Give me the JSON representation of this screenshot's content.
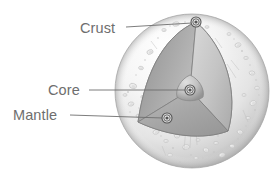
{
  "figure": {
    "background_color": "#ffffff"
  },
  "labels": [
    {
      "id": "crust",
      "text": "Crust",
      "text_x": 80,
      "text_y": 33,
      "line_x1": 126,
      "line_y1": 27,
      "line_x2": 192,
      "line_y2": 23,
      "marker_x": 196,
      "marker_y": 22
    },
    {
      "id": "core",
      "text": "Core",
      "text_x": 48,
      "text_y": 95,
      "line_x1": 89,
      "line_y1": 90,
      "line_x2": 185,
      "line_y2": 90,
      "marker_x": 190,
      "marker_y": 90
    },
    {
      "id": "mantle",
      "text": "Mantle",
      "text_x": 13,
      "text_y": 120,
      "line_x1": 70,
      "line_y1": 115,
      "line_x2": 163,
      "line_y2": 118,
      "marker_x": 167,
      "marker_y": 118
    }
  ],
  "sphere": {
    "center_x": 192,
    "center_y": 91,
    "radius": 77,
    "surface_color_light": "#fdfdfd",
    "surface_color_mid": "#e9e9e9",
    "surface_color_dark": "#c2c2c2",
    "outline_color": "#b4b4b4"
  },
  "cutaway": {
    "vertex_top_x": 196,
    "vertex_top_y": 22,
    "vertex_left_x": 138,
    "vertex_left_y": 122,
    "vertex_right_x": 228,
    "vertex_right_y": 131,
    "face_left_color": "#9d9d9d",
    "face_right_color": "#c9c9c9",
    "face_bottom_color": "#b0b0b0",
    "edge_color": "#808080"
  },
  "core_shape": {
    "center_x": 190,
    "center_y": 90,
    "size": 15,
    "fill_light": "#d6d6d6",
    "fill_dark": "#9b9b9b"
  },
  "markers": {
    "outer_radius": 5.0,
    "mid_radius": 3.2,
    "inner_radius": 1.6,
    "ring_color": "#555555",
    "fill_color": "#e8e8e8"
  },
  "craters": [
    {
      "cx": 150,
      "cy": 52,
      "rx": 3.2,
      "ry": 2.2,
      "rot": -20
    },
    {
      "cx": 141,
      "cy": 68,
      "rx": 2.4,
      "ry": 1.7,
      "rot": 10
    },
    {
      "cx": 133,
      "cy": 86,
      "rx": 3.6,
      "ry": 2.6,
      "rot": 15
    },
    {
      "cx": 143,
      "cy": 97,
      "rx": 2.2,
      "ry": 1.6,
      "rot": 0
    },
    {
      "cx": 131,
      "cy": 104,
      "rx": 2.8,
      "ry": 2.0,
      "rot": -10
    },
    {
      "cx": 147,
      "cy": 109,
      "rx": 1.8,
      "ry": 1.3,
      "rot": 0
    },
    {
      "cx": 138,
      "cy": 116,
      "rx": 2.0,
      "ry": 1.5,
      "rot": 25
    },
    {
      "cx": 156,
      "cy": 132,
      "rx": 3.0,
      "ry": 2.2,
      "rot": -15
    },
    {
      "cx": 166,
      "cy": 141,
      "rx": 2.2,
      "ry": 1.6,
      "rot": 0
    },
    {
      "cx": 177,
      "cy": 136,
      "rx": 2.6,
      "ry": 1.9,
      "rot": 10
    },
    {
      "cx": 186,
      "cy": 147,
      "rx": 3.4,
      "ry": 2.4,
      "rot": -5
    },
    {
      "cx": 198,
      "cy": 140,
      "rx": 2.0,
      "ry": 1.5,
      "rot": 0
    },
    {
      "cx": 206,
      "cy": 150,
      "rx": 2.8,
      "ry": 2.0,
      "rot": 20
    },
    {
      "cx": 216,
      "cy": 143,
      "rx": 2.2,
      "ry": 1.6,
      "rot": 0
    },
    {
      "cx": 222,
      "cy": 155,
      "rx": 3.0,
      "ry": 2.1,
      "rot": -10
    },
    {
      "cx": 232,
      "cy": 146,
      "rx": 2.4,
      "ry": 1.7,
      "rot": 5
    },
    {
      "cx": 240,
      "cy": 132,
      "rx": 2.8,
      "ry": 2.0,
      "rot": 15
    },
    {
      "cx": 248,
      "cy": 118,
      "rx": 2.2,
      "ry": 1.6,
      "rot": 0
    },
    {
      "cx": 253,
      "cy": 103,
      "rx": 3.2,
      "ry": 2.3,
      "rot": -20
    },
    {
      "cx": 257,
      "cy": 88,
      "rx": 2.4,
      "ry": 1.7,
      "rot": 0
    },
    {
      "cx": 252,
      "cy": 73,
      "rx": 2.8,
      "ry": 2.0,
      "rot": 10
    },
    {
      "cx": 246,
      "cy": 58,
      "rx": 2.2,
      "ry": 1.6,
      "rot": 0
    },
    {
      "cx": 238,
      "cy": 45,
      "rx": 3.0,
      "ry": 2.1,
      "rot": -15
    },
    {
      "cx": 229,
      "cy": 34,
      "rx": 2.0,
      "ry": 1.5,
      "rot": 0
    },
    {
      "cx": 176,
      "cy": 24,
      "rx": 3.4,
      "ry": 2.2,
      "rot": -10
    },
    {
      "cx": 164,
      "cy": 30,
      "rx": 2.2,
      "ry": 1.6,
      "rot": 0
    },
    {
      "cx": 244,
      "cy": 95,
      "rx": 2.0,
      "ry": 1.5,
      "rot": 0
    },
    {
      "cx": 234,
      "cy": 160,
      "rx": 1.8,
      "ry": 1.3,
      "rot": 0
    },
    {
      "cx": 196,
      "cy": 158,
      "rx": 2.0,
      "ry": 1.4,
      "rot": 0
    },
    {
      "cx": 170,
      "cy": 155,
      "rx": 2.4,
      "ry": 1.7,
      "rot": 0
    },
    {
      "cx": 125,
      "cy": 95,
      "rx": 2.0,
      "ry": 1.4,
      "rot": 0
    },
    {
      "cx": 207,
      "cy": 27,
      "rx": 2.0,
      "ry": 1.4,
      "rot": 0
    }
  ],
  "speckles": [
    {
      "cx": 145,
      "cy": 60,
      "r": 0.8
    },
    {
      "cx": 136,
      "cy": 75,
      "r": 0.7
    },
    {
      "cx": 128,
      "cy": 92,
      "r": 0.9
    },
    {
      "cx": 139,
      "cy": 108,
      "r": 0.7
    },
    {
      "cx": 151,
      "cy": 123,
      "r": 0.8
    },
    {
      "cx": 161,
      "cy": 136,
      "r": 0.7
    },
    {
      "cx": 173,
      "cy": 148,
      "r": 0.9
    },
    {
      "cx": 191,
      "cy": 155,
      "r": 0.8
    },
    {
      "cx": 203,
      "cy": 158,
      "r": 0.7
    },
    {
      "cx": 214,
      "cy": 152,
      "r": 0.9
    },
    {
      "cx": 227,
      "cy": 149,
      "r": 0.7
    },
    {
      "cx": 238,
      "cy": 139,
      "r": 0.8
    },
    {
      "cx": 246,
      "cy": 126,
      "r": 0.7
    },
    {
      "cx": 255,
      "cy": 110,
      "r": 0.9
    },
    {
      "cx": 259,
      "cy": 95,
      "r": 0.7
    },
    {
      "cx": 256,
      "cy": 80,
      "r": 0.8
    },
    {
      "cx": 250,
      "cy": 65,
      "r": 0.7
    },
    {
      "cx": 242,
      "cy": 51,
      "r": 0.9
    },
    {
      "cx": 234,
      "cy": 39,
      "r": 0.7
    },
    {
      "cx": 185,
      "cy": 22,
      "r": 0.8
    },
    {
      "cx": 170,
      "cy": 26,
      "r": 0.7
    },
    {
      "cx": 158,
      "cy": 38,
      "r": 0.8
    },
    {
      "cx": 130,
      "cy": 112,
      "r": 0.7
    },
    {
      "cx": 218,
      "cy": 136,
      "r": 0.7
    },
    {
      "cx": 180,
      "cy": 162,
      "r": 0.8
    },
    {
      "cx": 209,
      "cy": 163,
      "r": 0.7
    }
  ],
  "streaks": [
    {
      "x1": 186,
      "y1": 128,
      "x2": 184,
      "y2": 150
    },
    {
      "x1": 191,
      "y1": 130,
      "x2": 190,
      "y2": 148
    },
    {
      "x1": 196,
      "y1": 129,
      "x2": 197,
      "y2": 145
    },
    {
      "x1": 227,
      "y1": 64,
      "x2": 236,
      "y2": 78
    },
    {
      "x1": 231,
      "y1": 60,
      "x2": 239,
      "y2": 70
    },
    {
      "x1": 215,
      "y1": 38,
      "x2": 222,
      "y2": 48
    },
    {
      "x1": 243,
      "y1": 110,
      "x2": 248,
      "y2": 122
    },
    {
      "x1": 151,
      "y1": 41,
      "x2": 157,
      "y2": 49
    },
    {
      "x1": 162,
      "y1": 146,
      "x2": 166,
      "y2": 156
    }
  ]
}
